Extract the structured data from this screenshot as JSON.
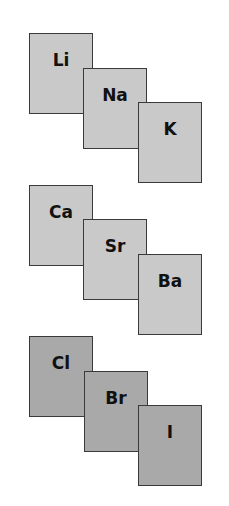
{
  "groups": [
    {
      "name": "alkali-metals",
      "color": "#c9c9c9",
      "elements": [
        {
          "symbol": "Li"
        },
        {
          "symbol": "Na"
        },
        {
          "symbol": "K"
        }
      ]
    },
    {
      "name": "alkaline-earth-metals",
      "color": "#c9c9c9",
      "elements": [
        {
          "symbol": "Ca"
        },
        {
          "symbol": "Sr"
        },
        {
          "symbol": "Ba"
        }
      ]
    },
    {
      "name": "halogens",
      "color": "#a9a9a9",
      "elements": [
        {
          "symbol": "Cl"
        },
        {
          "symbol": "Br"
        },
        {
          "symbol": "I"
        }
      ]
    }
  ]
}
